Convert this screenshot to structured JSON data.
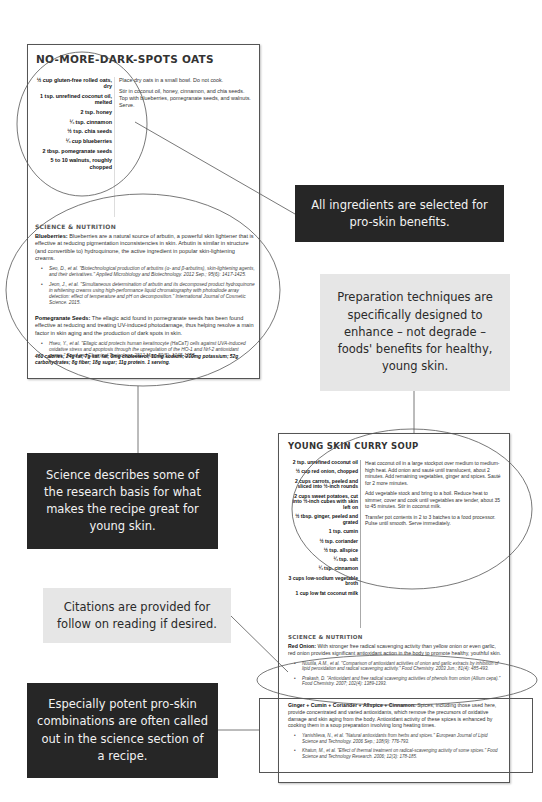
{
  "recipe1": {
    "title": "NO-MORE-DARK-SPOTS OATS",
    "ingredients": [
      "½ cup gluten-free rolled oats, dry",
      "1 tsp. unrefined coconut oil, melted",
      "2 tsp. honey",
      "¼ tsp. cinnamon",
      "½ tsp. chia seeds",
      "¼ cup blueberries",
      "2 tbsp. pomegranate seeds",
      "5 to 10 walnuts, roughly chopped"
    ],
    "directions": [
      "Place dry oats in a small bowl. Do not cook.",
      "Stir in coconut oil, honey, cinnamon, and chia seeds. Top with blueberries, pomegranate seeds, and walnuts. Serve."
    ],
    "science_heading": "SCIENCE & NUTRITION",
    "science": [
      {
        "label": "Blueberries:",
        "text": " Blueberries are a natural source of arbutin, a powerful skin lightener that is effective at reducing pigmentation inconsistencies in skin. Arbutin is similar in structure (and convertible to) hydroquinone, the active ingredient in popular skin-lightening creams.",
        "citations": [
          "Seo, D., et al. \"Biotechnological production of arbutins (α- and β-arbutins), skin-lightening agents, and their derivatives.\" Applied Microbiology and Biotechnology. 2012 Sep.; 95(6): 1417-1425.",
          "Jeon, J., et al. \"Simultaneous determination of arbutin and its decomposed product hydroquinone in whitening creams using high-performance liquid chromatography with photodiode array detection: effect of temperature and pH on decomposition.\" International Journal of Cosmetic Science. 2015."
        ]
      },
      {
        "label": "Pomegranate Seeds:",
        "text": " The ellagic acid found in pomegranate seeds has been found effective at reducing and treating UV-induced photodamage, thus helping resolve a main factor in skin aging and the production of dark spots in skin.",
        "citations": [
          "Hseu, Y., et al. \"Ellagic acid protects human keratinocyte (HaCaT) cells against UVA-induced oxidative stress and apoptosis through the upregulation of the HO-1 and Nrf-2 antioxidant genes.\" Food and Chemical Toxicology. 2012 May; 50(5): 1245-1255."
        ]
      }
    ],
    "nutrition": "460 calories; 24g fat; 7g sat. fat; 0mg cholesterol; 10mg sodium; 210mg potassium; 52g carbohydrates; 8g fiber; 18g sugar; 11g protein. 1 serving."
  },
  "recipe2": {
    "title": "YOUNG SKIN CURRY SOUP",
    "ingredients": [
      "2 tsp. unrefined coconut oil",
      "½ cup red onion, chopped",
      "2 cups carrots, peeled and sliced into ½-inch rounds",
      "2 cups sweet potatoes, cut into ½-inch cubes with skin left on",
      "½ tbsp. ginger, peeled and grated",
      "1 tsp. cumin",
      "½ tsp. coriander",
      "½ tsp. allspice",
      "¼ tsp. salt",
      "¼ tsp. cinnamon",
      "3 cups low-sodium vegetable broth",
      "1 cup low fat coconut milk"
    ],
    "directions": [
      "Heat coconut oil in a large stockpot over medium to medium-high heat. Add onion and sauté until translucent, about 2 minutes. Add remaining vegetables, ginger and spices. Sauté for 2 more minutes.",
      "Add vegetable stock and bring to a boil. Reduce heat to simmer, cover and cook until vegetables are tender, about 35 to 45 minutes. Stir in coconut milk.",
      "Transfer pot contents in 2 to 3 batches to a food processor. Pulse until smooth. Serve immediately."
    ],
    "science_heading": "SCIENCE & NUTRITION",
    "science": [
      {
        "label": "Red Onion:",
        "text": " With stronger free radical scavenging activity than yellow onion or even garlic, red onion provides significant antioxidant action in the body to promote healthy, youthful skin.",
        "citations": [
          "Nuutila, A.M., et al. \"Comparison of antioxidant activities of onion and garlic extracts by inhibition of lipid peroxidation and radical scavenging activity.\" Food Chemistry. 2003 Jun.; 81(4): 485-493.",
          "Prakash, D. \"Antioxidant and free radical scavenging activities of phenols from onion (Allium cepa).\" Food Chemistry. 2007; 102(4): 1389-1393."
        ]
      },
      {
        "label": "Ginger + Cumin + Coriander + Allspice + Cinnamon:",
        "text": " Spices, including those used here, provide concentrated and varied antioxidants, which remove the precursors of oxidative damage and skin aging from the body. Antioxidant activity of these spices is enhanced by cooking them in a soup preparation involving long heating times.",
        "citations": [
          "Yanishlieva, N., et al. \"Natural antioxidants from herbs and spices.\" European Journal of Lipid Science and Technology. 2006 Sep.; 108(9): 776-793.",
          "Khatun, M., et al. \"Effect of thermal treatment on radical-scavenging activity of some spices.\" Food Science and Technology Research. 2006; 12(3): 178-185."
        ]
      }
    ]
  },
  "callouts": {
    "ingredients": "All ingredients are selected for pro-skin benefits.",
    "preparation": "Preparation techniques are specifically designed to enhance – not degrade – foods' benefits for healthy, young skin.",
    "science": "Science describes some of the research basis for what makes the recipe great for young skin.",
    "citations": "Citations are provided for follow on reading if desired.",
    "combinations": "Especially potent pro-skin combinations are often called out in the science section of a recipe."
  },
  "colors": {
    "dark_callout": "#262626",
    "light_callout": "#e6e6e6",
    "annotation_line": "#555555"
  }
}
